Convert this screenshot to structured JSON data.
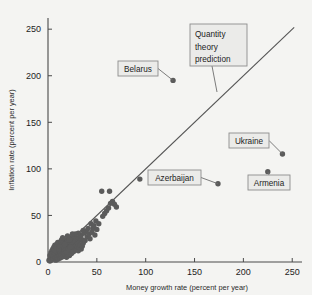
{
  "chart_data": {
    "type": "scatter",
    "title": "",
    "xlabel": "Money growth rate (percent per year)",
    "ylabel": "Inflation rate (percent per year)",
    "xlim": [
      0,
      260
    ],
    "ylim": [
      0,
      262
    ],
    "xticks": [
      0,
      50,
      100,
      150,
      200,
      250
    ],
    "yticks": [
      0,
      50,
      100,
      150,
      200,
      250
    ],
    "xtick_labels": [
      "0",
      "50",
      "100",
      "150",
      "200",
      "250"
    ],
    "ytick_labels": [
      "0",
      "50",
      "100",
      "150",
      "200",
      "250"
    ],
    "grid": false,
    "legend": "none",
    "reference_line": {
      "label": "Quantity theory prediction",
      "label_lines": [
        "Quantity",
        "theory",
        "prediction"
      ],
      "slope": 1,
      "intercept": 0,
      "x_start": 0,
      "x_end": 252,
      "y_start": 0,
      "y_end": 252
    },
    "annotations": [
      {
        "label": "Belarus",
        "x": 128,
        "y": 195
      },
      {
        "label": "Ukraine",
        "x": 240,
        "y": 116
      },
      {
        "label": "Armenia",
        "x": 225,
        "y": 97
      },
      {
        "label": "Azerbaijan",
        "x": 174,
        "y": 84
      }
    ],
    "points": [
      {
        "x": 128,
        "y": 195
      },
      {
        "x": 240,
        "y": 116
      },
      {
        "x": 225,
        "y": 97
      },
      {
        "x": 174,
        "y": 84
      },
      {
        "x": 94,
        "y": 89
      },
      {
        "x": 66,
        "y": 65
      },
      {
        "x": 68,
        "y": 62
      },
      {
        "x": 70,
        "y": 59
      },
      {
        "x": 64,
        "y": 63
      },
      {
        "x": 55,
        "y": 76
      },
      {
        "x": 63,
        "y": 76
      },
      {
        "x": 56,
        "y": 49
      },
      {
        "x": 49,
        "y": 44
      },
      {
        "x": 44,
        "y": 41
      },
      {
        "x": 46,
        "y": 36
      },
      {
        "x": 41,
        "y": 36
      },
      {
        "x": 39,
        "y": 33
      },
      {
        "x": 37,
        "y": 31
      },
      {
        "x": 36,
        "y": 34
      },
      {
        "x": 34,
        "y": 29
      },
      {
        "x": 33,
        "y": 27
      },
      {
        "x": 35,
        "y": 24
      },
      {
        "x": 32,
        "y": 23
      },
      {
        "x": 31,
        "y": 31
      },
      {
        "x": 30,
        "y": 21
      },
      {
        "x": 29,
        "y": 26
      },
      {
        "x": 28,
        "y": 19
      },
      {
        "x": 27,
        "y": 24
      },
      {
        "x": 26,
        "y": 17
      },
      {
        "x": 25,
        "y": 22
      },
      {
        "x": 24,
        "y": 15
      },
      {
        "x": 23,
        "y": 20
      },
      {
        "x": 22,
        "y": 13
      },
      {
        "x": 21,
        "y": 18
      },
      {
        "x": 20,
        "y": 12
      },
      {
        "x": 19,
        "y": 16
      },
      {
        "x": 18,
        "y": 11
      },
      {
        "x": 17,
        "y": 14
      },
      {
        "x": 16,
        "y": 10
      },
      {
        "x": 15,
        "y": 13
      },
      {
        "x": 14,
        "y": 9
      },
      {
        "x": 13,
        "y": 12
      },
      {
        "x": 12,
        "y": 8
      },
      {
        "x": 11,
        "y": 11
      },
      {
        "x": 10,
        "y": 7
      },
      {
        "x": 9,
        "y": 10
      },
      {
        "x": 8,
        "y": 6
      },
      {
        "x": 7,
        "y": 9
      },
      {
        "x": 6,
        "y": 5
      },
      {
        "x": 5,
        "y": 8
      },
      {
        "x": 4,
        "y": 4
      },
      {
        "x": 3,
        "y": 6
      },
      {
        "x": 2,
        "y": 3
      },
      {
        "x": 1,
        "y": 2
      },
      {
        "x": 2,
        "y": 7
      },
      {
        "x": 3,
        "y": 10
      },
      {
        "x": 4,
        "y": 12
      },
      {
        "x": 5,
        "y": 14
      },
      {
        "x": 6,
        "y": 16
      },
      {
        "x": 7,
        "y": 18
      },
      {
        "x": 8,
        "y": 13
      },
      {
        "x": 9,
        "y": 15
      },
      {
        "x": 10,
        "y": 17
      },
      {
        "x": 11,
        "y": 19
      },
      {
        "x": 12,
        "y": 21
      },
      {
        "x": 13,
        "y": 16
      },
      {
        "x": 14,
        "y": 18
      },
      {
        "x": 15,
        "y": 20
      },
      {
        "x": 16,
        "y": 22
      },
      {
        "x": 17,
        "y": 24
      },
      {
        "x": 18,
        "y": 19
      },
      {
        "x": 19,
        "y": 21
      },
      {
        "x": 20,
        "y": 23
      },
      {
        "x": 21,
        "y": 9
      },
      {
        "x": 22,
        "y": 7
      },
      {
        "x": 23,
        "y": 11
      },
      {
        "x": 24,
        "y": 26
      },
      {
        "x": 25,
        "y": 12
      },
      {
        "x": 26,
        "y": 28
      },
      {
        "x": 27,
        "y": 14
      },
      {
        "x": 28,
        "y": 30
      },
      {
        "x": 2,
        "y": 1
      },
      {
        "x": 3,
        "y": 2
      },
      {
        "x": 4,
        "y": 8
      },
      {
        "x": 5,
        "y": 3
      },
      {
        "x": 6,
        "y": 10
      },
      {
        "x": 7,
        "y": 4
      },
      {
        "x": 8,
        "y": 2
      },
      {
        "x": 9,
        "y": 5
      },
      {
        "x": 10,
        "y": 3
      },
      {
        "x": 11,
        "y": 6
      },
      {
        "x": 12,
        "y": 4
      },
      {
        "x": 13,
        "y": 7
      },
      {
        "x": 14,
        "y": 5
      },
      {
        "x": 15,
        "y": 8
      },
      {
        "x": 16,
        "y": 6
      },
      {
        "x": 17,
        "y": 9
      },
      {
        "x": 18,
        "y": 7
      },
      {
        "x": 19,
        "y": 5
      },
      {
        "x": 20,
        "y": 8
      },
      {
        "x": 6,
        "y": 13
      },
      {
        "x": 7,
        "y": 12
      },
      {
        "x": 8,
        "y": 16
      },
      {
        "x": 9,
        "y": 19
      },
      {
        "x": 10,
        "y": 21
      },
      {
        "x": 11,
        "y": 14
      },
      {
        "x": 12,
        "y": 17
      },
      {
        "x": 13,
        "y": 22
      },
      {
        "x": 14,
        "y": 24
      },
      {
        "x": 15,
        "y": 26
      },
      {
        "x": 16,
        "y": 16
      },
      {
        "x": 17,
        "y": 19
      },
      {
        "x": 18,
        "y": 13
      },
      {
        "x": 19,
        "y": 11
      },
      {
        "x": 20,
        "y": 28
      },
      {
        "x": 21,
        "y": 14
      },
      {
        "x": 22,
        "y": 24
      },
      {
        "x": 23,
        "y": 16
      },
      {
        "x": 24,
        "y": 9
      },
      {
        "x": 25,
        "y": 30
      },
      {
        "x": 26,
        "y": 11
      },
      {
        "x": 29,
        "y": 13
      },
      {
        "x": 30,
        "y": 16
      },
      {
        "x": 31,
        "y": 12
      },
      {
        "x": 32,
        "y": 15
      },
      {
        "x": 33,
        "y": 18
      },
      {
        "x": 34,
        "y": 14
      },
      {
        "x": 35,
        "y": 17
      },
      {
        "x": 36,
        "y": 20
      },
      {
        "x": 38,
        "y": 23
      },
      {
        "x": 40,
        "y": 27
      },
      {
        "x": 42,
        "y": 30
      },
      {
        "x": 43,
        "y": 25
      },
      {
        "x": 45,
        "y": 32
      },
      {
        "x": 47,
        "y": 39
      },
      {
        "x": 48,
        "y": 29
      },
      {
        "x": 50,
        "y": 35
      },
      {
        "x": 52,
        "y": 41
      },
      {
        "x": 58,
        "y": 52
      },
      {
        "x": 60,
        "y": 55
      },
      {
        "x": 62,
        "y": 58
      }
    ]
  }
}
